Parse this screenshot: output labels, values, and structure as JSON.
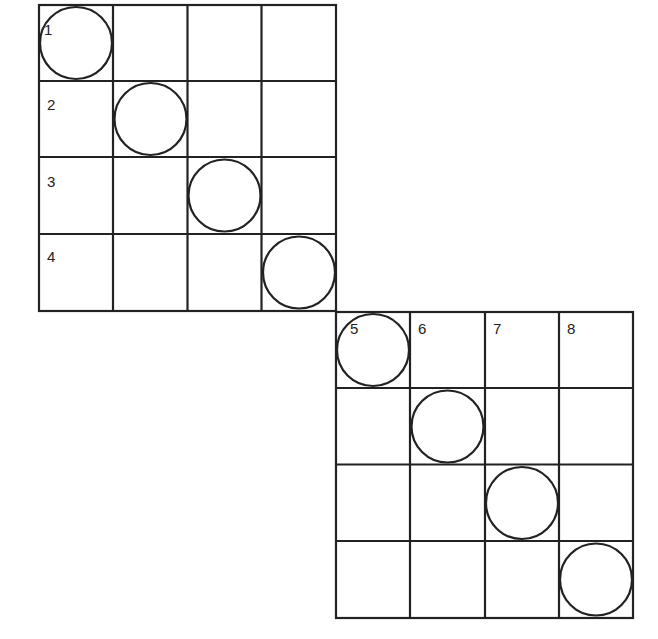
{
  "diagram": {
    "colors": {
      "line": "#222222",
      "background": "#ffffff"
    },
    "grids": [
      {
        "id": "grid-1",
        "origin": [
          38,
          4
        ],
        "cell_size": 74.5,
        "rows": 4,
        "cols": 4,
        "labels": [
          {
            "text": "1",
            "row": 0,
            "col": 0
          },
          {
            "text": "2",
            "row": 1,
            "col": 0
          },
          {
            "text": "3",
            "row": 2,
            "col": 0
          },
          {
            "text": "4",
            "row": 3,
            "col": 0
          }
        ],
        "circles": [
          [
            0,
            0
          ],
          [
            1,
            1
          ],
          [
            2,
            2
          ],
          [
            3,
            3
          ]
        ]
      },
      {
        "id": "grid-2",
        "origin": [
          335,
          311
        ],
        "cell_size": 74.75,
        "rows": 4,
        "cols": 4,
        "labels": [
          {
            "text": "5",
            "row": 0,
            "col": 0
          },
          {
            "text": "6",
            "row": 0,
            "col": 1
          },
          {
            "text": "7",
            "row": 0,
            "col": 2
          },
          {
            "text": "8",
            "row": 0,
            "col": 3
          }
        ],
        "circles": [
          [
            0,
            0
          ],
          [
            1,
            1
          ],
          [
            2,
            2
          ],
          [
            3,
            3
          ]
        ]
      }
    ]
  }
}
